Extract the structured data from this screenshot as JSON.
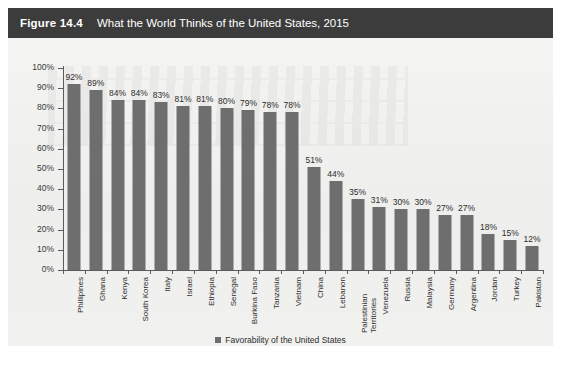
{
  "header": {
    "figure_number": "Figure 14.4",
    "title": "What the World Thinks of the United States, 2015"
  },
  "legend": {
    "label": "Favorability of the United States",
    "swatch_color": "#6e6e6e"
  },
  "colors": {
    "header_bar": "#3c3c3c",
    "header_text": "#ffffff",
    "bar_fill": "#6e6e6e",
    "plot_background": "#f1f1ef",
    "axis_line": "#5a5a5a",
    "text": "#2d2d2d"
  },
  "chart_data": {
    "type": "bar",
    "title": "What the World Thinks of the United States, 2015",
    "xlabel": "",
    "ylabel": "",
    "ylim": [
      0,
      100
    ],
    "yticks": [
      "0%",
      "10%",
      "20%",
      "30%",
      "40%",
      "50%",
      "60%",
      "70%",
      "80%",
      "90%",
      "100%"
    ],
    "grid": false,
    "legend_position": "bottom-center",
    "series": [
      {
        "name": "Favorability of the United States",
        "values": [
          92,
          89,
          84,
          84,
          83,
          81,
          81,
          80,
          79,
          78,
          78,
          51,
          44,
          35,
          31,
          30,
          30,
          27,
          27,
          18,
          15,
          12
        ]
      }
    ],
    "categories": [
      "Phillipines",
      "Ghana",
      "Kenya",
      "South Korea",
      "Italy",
      "Israel",
      "Ethiopia",
      "Senegal",
      "Burkina Faso",
      "Tanzania",
      "Vietnam",
      "China",
      "Lebanon",
      "Palestinian Territories",
      "Venezuela",
      "Russia",
      "Malaysia",
      "Germany",
      "Argentina",
      "Jordan",
      "Turkey",
      "Pakistan"
    ],
    "data_labels": [
      "92%",
      "89%",
      "84%",
      "84%",
      "83%",
      "81%",
      "81%",
      "80%",
      "79%",
      "78%",
      "78%",
      "51%",
      "44%",
      "35%",
      "31%",
      "30%",
      "30%",
      "27%",
      "27%",
      "18%",
      "15%",
      "12%"
    ]
  }
}
